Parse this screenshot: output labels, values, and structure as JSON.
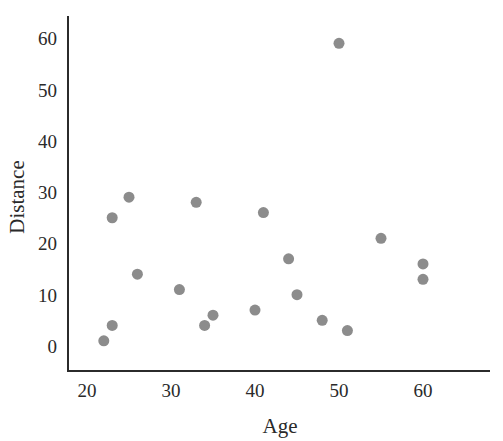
{
  "chart_data": {
    "type": "scatter",
    "title": "",
    "xlabel": "Age",
    "ylabel": "Distance",
    "xlim": [
      17,
      67
    ],
    "ylim": [
      -5,
      65
    ],
    "xticks": [
      20,
      30,
      40,
      50,
      60
    ],
    "yticks": [
      0,
      10,
      20,
      30,
      40,
      50,
      60
    ],
    "grid": false,
    "legend": null,
    "point_color": "#8c8c8c",
    "points": [
      {
        "x": 22,
        "y": 1
      },
      {
        "x": 23,
        "y": 4
      },
      {
        "x": 23,
        "y": 25
      },
      {
        "x": 25,
        "y": 29
      },
      {
        "x": 26,
        "y": 14
      },
      {
        "x": 31,
        "y": 11
      },
      {
        "x": 33,
        "y": 28
      },
      {
        "x": 34,
        "y": 4
      },
      {
        "x": 35,
        "y": 6
      },
      {
        "x": 40,
        "y": 7
      },
      {
        "x": 41,
        "y": 26
      },
      {
        "x": 44,
        "y": 17
      },
      {
        "x": 45,
        "y": 10
      },
      {
        "x": 48,
        "y": 5
      },
      {
        "x": 50,
        "y": 59
      },
      {
        "x": 51,
        "y": 3
      },
      {
        "x": 55,
        "y": 21
      },
      {
        "x": 60,
        "y": 16
      },
      {
        "x": 60,
        "y": 13
      }
    ]
  },
  "axes": {
    "x_label": "Age",
    "y_label": "Distance"
  }
}
